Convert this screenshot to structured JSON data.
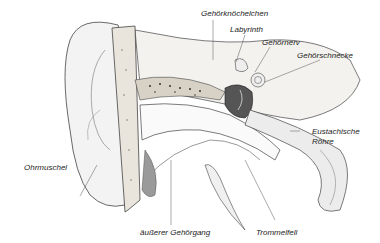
{
  "diagram": {
    "colors": {
      "background": "#ffffff",
      "line": "#333333",
      "bone": "#e9e4dc",
      "shade": "#9a9a9a",
      "label": "#222222"
    },
    "labels": {
      "gehoerknoechelchen": "Gehörknöchelchen",
      "labyrinth": "Labyrinth",
      "gehoernerv": "Gehörnerv",
      "gehoerschnecke": "Gehörschnecke",
      "eustachische_1": "Eustachische",
      "eustachische_2": "Röhre",
      "ohrmuschel": "Ohrmuschel",
      "aeusserer_gehoergang": "äußerer Gehörgang",
      "trommelfell": "Trommelfell"
    }
  }
}
